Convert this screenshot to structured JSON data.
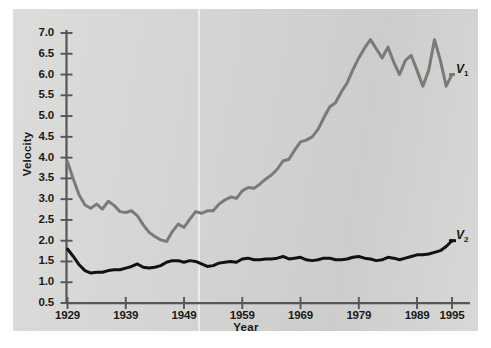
{
  "chart_data": {
    "type": "line",
    "title": "",
    "xlabel": "Year",
    "ylabel": "Velocity",
    "xlim": [
      1929,
      1995
    ],
    "ylim": [
      0.5,
      7.0
    ],
    "grid": false,
    "legend_position": "right-inline",
    "xticks": [
      "1929",
      "1939",
      "1949",
      "1959",
      "1969",
      "1979",
      "1989",
      "1995"
    ],
    "xtick_values": [
      1929,
      1939,
      1949,
      1959,
      1969,
      1979,
      1989,
      1995
    ],
    "yticks": [
      "0.5",
      "1.0",
      "1.5",
      "2.0",
      "2.5",
      "3.0",
      "3.5",
      "4.0",
      "4.5",
      "5.0",
      "5.5",
      "6.0",
      "6.5",
      "7.0"
    ],
    "ytick_values": [
      0.5,
      1.0,
      1.5,
      2.0,
      2.5,
      3.0,
      3.5,
      4.0,
      4.5,
      5.0,
      5.5,
      6.0,
      6.5,
      7.0
    ],
    "x": [
      1929,
      1930,
      1931,
      1932,
      1933,
      1934,
      1935,
      1936,
      1937,
      1938,
      1939,
      1940,
      1941,
      1942,
      1943,
      1944,
      1945,
      1946,
      1947,
      1948,
      1949,
      1950,
      1951,
      1952,
      1953,
      1954,
      1955,
      1956,
      1957,
      1958,
      1959,
      1960,
      1961,
      1962,
      1963,
      1964,
      1965,
      1966,
      1967,
      1968,
      1969,
      1970,
      1971,
      1972,
      1973,
      1974,
      1975,
      1976,
      1977,
      1978,
      1979,
      1980,
      1981,
      1982,
      1983,
      1984,
      1985,
      1986,
      1987,
      1988,
      1989,
      1990,
      1991,
      1992,
      1993,
      1994,
      1995
    ],
    "series": [
      {
        "name": "V1",
        "label": "V₁",
        "color": "#7a7a78",
        "values": [
          3.9,
          3.48,
          3.1,
          2.86,
          2.78,
          2.88,
          2.76,
          2.95,
          2.85,
          2.7,
          2.68,
          2.72,
          2.6,
          2.38,
          2.2,
          2.1,
          2.02,
          1.98,
          2.22,
          2.4,
          2.32,
          2.52,
          2.7,
          2.66,
          2.72,
          2.72,
          2.88,
          2.98,
          3.05,
          3.02,
          3.2,
          3.28,
          3.26,
          3.36,
          3.48,
          3.58,
          3.72,
          3.92,
          3.96,
          4.18,
          4.38,
          4.42,
          4.5,
          4.68,
          4.96,
          5.22,
          5.32,
          5.58,
          5.8,
          6.12,
          6.4,
          6.64,
          6.84,
          6.62,
          6.4,
          6.66,
          6.3,
          6.0,
          6.34,
          6.46,
          6.1,
          5.72,
          6.1,
          6.84,
          6.34,
          5.72,
          6.0
        ]
      },
      {
        "name": "V2",
        "label": "V₂",
        "color": "#111111",
        "values": [
          1.8,
          1.62,
          1.42,
          1.28,
          1.22,
          1.24,
          1.24,
          1.28,
          1.3,
          1.3,
          1.34,
          1.38,
          1.44,
          1.36,
          1.34,
          1.36,
          1.4,
          1.48,
          1.52,
          1.52,
          1.48,
          1.52,
          1.5,
          1.44,
          1.38,
          1.4,
          1.46,
          1.48,
          1.5,
          1.48,
          1.56,
          1.58,
          1.54,
          1.54,
          1.56,
          1.56,
          1.58,
          1.62,
          1.56,
          1.58,
          1.6,
          1.54,
          1.52,
          1.54,
          1.58,
          1.58,
          1.54,
          1.54,
          1.56,
          1.6,
          1.62,
          1.58,
          1.56,
          1.52,
          1.54,
          1.6,
          1.58,
          1.54,
          1.58,
          1.62,
          1.66,
          1.66,
          1.68,
          1.72,
          1.76,
          1.86,
          2.0
        ]
      }
    ]
  },
  "axes": {
    "x_axis_label": "Year",
    "y_axis_label": "Velocity"
  }
}
